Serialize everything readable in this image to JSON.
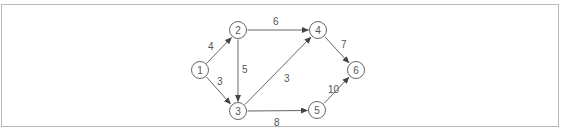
{
  "diagram": {
    "type": "directed-weighted-graph",
    "colors": {
      "stroke": "#555555",
      "frame": "#b8b8b8",
      "background": "#ffffff"
    },
    "nodes": [
      {
        "id": "1",
        "label": "1",
        "x": 200,
        "y": 70
      },
      {
        "id": "2",
        "label": "2",
        "x": 238,
        "y": 30
      },
      {
        "id": "3",
        "label": "3",
        "x": 238,
        "y": 111
      },
      {
        "id": "4",
        "label": "4",
        "x": 318,
        "y": 30
      },
      {
        "id": "5",
        "label": "5",
        "x": 317,
        "y": 110
      },
      {
        "id": "6",
        "label": "6",
        "x": 356,
        "y": 70
      }
    ],
    "edges": [
      {
        "from": "1",
        "to": "2",
        "weight": "4"
      },
      {
        "from": "1",
        "to": "3",
        "weight": "3"
      },
      {
        "from": "2",
        "to": "3",
        "weight": "5"
      },
      {
        "from": "2",
        "to": "4",
        "weight": "6"
      },
      {
        "from": "3",
        "to": "4",
        "weight": "3"
      },
      {
        "from": "3",
        "to": "5",
        "weight": "8"
      },
      {
        "from": "4",
        "to": "6",
        "weight": "7"
      },
      {
        "from": "5",
        "to": "6",
        "weight": "10"
      }
    ]
  }
}
